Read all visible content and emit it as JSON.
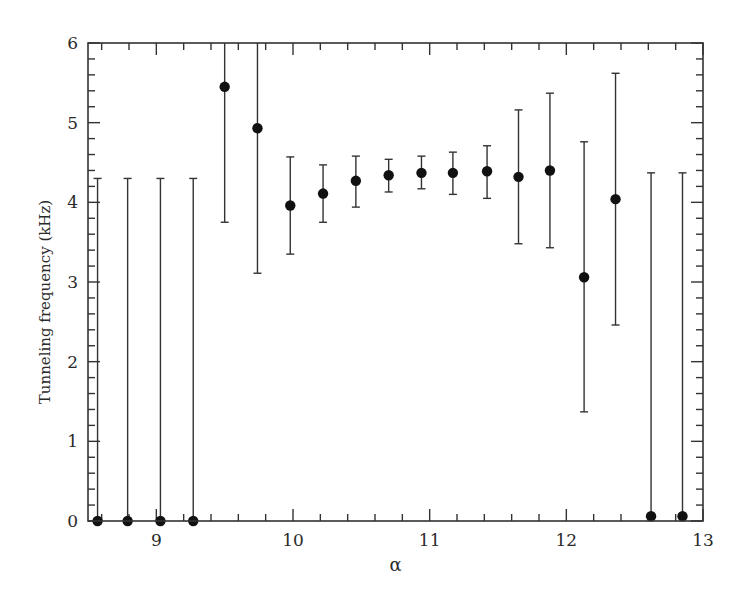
{
  "chart_data": {
    "type": "scatter",
    "title": "",
    "xlabel": "α",
    "ylabel": "Tunneling frequency (kHz)",
    "xlim": [
      8.5,
      13
    ],
    "ylim": [
      0,
      6
    ],
    "xticks": [
      9,
      10,
      11,
      12,
      13
    ],
    "xtick_labels": [
      "9",
      "10",
      "11",
      "12",
      "13"
    ],
    "x_minor_step": 0.2,
    "yticks": [
      0,
      1,
      2,
      3,
      4,
      5,
      6
    ],
    "ytick_labels": [
      "0",
      "1",
      "2",
      "3",
      "4",
      "5",
      "6"
    ],
    "y_minor_step": 0.2,
    "grid": false,
    "legend": "none",
    "series": [
      {
        "name": "Tunneling frequency",
        "marker": "filled-circle",
        "color": "#111111",
        "points": [
          {
            "x": 8.57,
            "y": 0.0,
            "err_low": 0.0,
            "err_high": 4.3
          },
          {
            "x": 8.79,
            "y": 0.0,
            "err_low": 0.0,
            "err_high": 4.3
          },
          {
            "x": 9.03,
            "y": 0.0,
            "err_low": 0.0,
            "err_high": 4.3
          },
          {
            "x": 9.27,
            "y": 0.0,
            "err_low": 0.0,
            "err_high": 4.3
          },
          {
            "x": 9.5,
            "y": 5.45,
            "err_low": 3.75,
            "err_high": 6.0
          },
          {
            "x": 9.74,
            "y": 4.93,
            "err_low": 3.11,
            "err_high": 6.0
          },
          {
            "x": 9.98,
            "y": 3.96,
            "err_low": 3.35,
            "err_high": 4.57
          },
          {
            "x": 10.22,
            "y": 4.11,
            "err_low": 3.75,
            "err_high": 4.47
          },
          {
            "x": 10.46,
            "y": 4.27,
            "err_low": 3.94,
            "err_high": 4.58
          },
          {
            "x": 10.7,
            "y": 4.34,
            "err_low": 4.13,
            "err_high": 4.54
          },
          {
            "x": 10.94,
            "y": 4.37,
            "err_low": 4.17,
            "err_high": 4.58
          },
          {
            "x": 11.17,
            "y": 4.37,
            "err_low": 4.1,
            "err_high": 4.63
          },
          {
            "x": 11.42,
            "y": 4.39,
            "err_low": 4.05,
            "err_high": 4.71
          },
          {
            "x": 11.65,
            "y": 4.32,
            "err_low": 3.48,
            "err_high": 5.16
          },
          {
            "x": 11.88,
            "y": 4.4,
            "err_low": 3.43,
            "err_high": 5.37
          },
          {
            "x": 12.13,
            "y": 3.06,
            "err_low": 1.37,
            "err_high": 4.76
          },
          {
            "x": 12.36,
            "y": 4.04,
            "err_low": 2.46,
            "err_high": 5.62
          },
          {
            "x": 12.62,
            "y": 0.06,
            "err_low": 0.0,
            "err_high": 4.37
          },
          {
            "x": 12.85,
            "y": 0.06,
            "err_low": 0.0,
            "err_high": 4.37
          }
        ]
      }
    ]
  }
}
